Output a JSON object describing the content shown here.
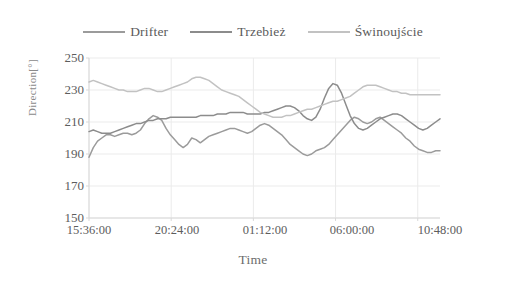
{
  "chart_data": {
    "type": "line",
    "title": "",
    "xlabel": "Time",
    "ylabel": "Direction[°]",
    "ylim": [
      150,
      250
    ],
    "yticks": [
      150,
      170,
      190,
      210,
      230,
      250
    ],
    "xticks": [
      "15:36:00",
      "20:24:00",
      "01:12:00",
      "06:00:00",
      "10:48:00"
    ],
    "xtick_minutes": [
      936,
      1224,
      72,
      360,
      648
    ],
    "grid": true,
    "legend_position": "top-center",
    "x_unit": "hours from 15:36:00",
    "xlim_hours": [
      0,
      20.5
    ],
    "series": [
      {
        "name": "Drifter",
        "color": "#9b9b9b",
        "x": [
          0.0,
          0.25,
          0.5,
          0.75,
          1.0,
          1.25,
          1.5,
          1.75,
          2.0,
          2.25,
          2.5,
          2.75,
          3.0,
          3.25,
          3.5,
          3.75,
          4.0,
          4.25,
          4.5,
          4.75,
          5.0,
          5.25,
          5.5,
          5.75,
          6.0,
          6.25,
          6.5,
          6.75,
          7.0,
          7.25,
          7.5,
          7.75,
          8.0,
          8.25,
          8.5,
          8.75,
          9.0,
          9.25,
          9.5,
          9.75,
          10.0,
          10.25,
          10.5,
          10.75,
          11.0,
          11.25,
          11.5,
          11.75,
          12.0,
          12.25,
          12.5,
          12.75,
          13.0,
          13.25,
          13.5,
          13.75,
          14.0,
          14.25,
          14.5,
          14.75,
          15.0,
          15.25,
          15.5,
          15.75,
          16.0,
          16.25,
          16.5,
          16.75,
          17.0,
          17.25,
          17.5,
          17.75,
          18.0,
          18.25,
          18.5,
          18.75,
          19.0,
          19.25,
          19.5,
          19.75,
          20.0,
          20.25,
          20.5
        ],
        "y": [
          188,
          194,
          198,
          200,
          202,
          202,
          201,
          202,
          203,
          203,
          202,
          203,
          205,
          209,
          212,
          214,
          213,
          211,
          206,
          202,
          199,
          196,
          194,
          196,
          200,
          199,
          197,
          199,
          201,
          202,
          203,
          204,
          205,
          206,
          206,
          205,
          204,
          203,
          204,
          206,
          208,
          209,
          208,
          206,
          204,
          202,
          199,
          196,
          194,
          192,
          190,
          189,
          190,
          192,
          193,
          194,
          196,
          199,
          202,
          205,
          208,
          211,
          213,
          212,
          210,
          209,
          210,
          212,
          213,
          211,
          209,
          207,
          205,
          203,
          200,
          198,
          195,
          193,
          192,
          191,
          191,
          192,
          192
        ]
      },
      {
        "name": "Trzebież",
        "color": "#8c8c8c",
        "x": [
          0.0,
          0.25,
          0.5,
          0.75,
          1.0,
          1.25,
          1.5,
          1.75,
          2.0,
          2.25,
          2.5,
          2.75,
          3.0,
          3.25,
          3.5,
          3.75,
          4.0,
          4.25,
          4.5,
          4.75,
          5.0,
          5.25,
          5.5,
          5.75,
          6.0,
          6.25,
          6.5,
          6.75,
          7.0,
          7.25,
          7.5,
          7.75,
          8.0,
          8.25,
          8.5,
          8.75,
          9.0,
          9.25,
          9.5,
          9.75,
          10.0,
          10.25,
          10.5,
          10.75,
          11.0,
          11.25,
          11.5,
          11.75,
          12.0,
          12.25,
          12.5,
          12.75,
          13.0,
          13.25,
          13.5,
          13.75,
          14.0,
          14.25,
          14.5,
          14.75,
          15.0,
          15.25,
          15.5,
          15.75,
          16.0,
          16.25,
          16.5,
          16.75,
          17.0,
          17.25,
          17.5,
          17.75,
          18.0,
          18.25,
          18.5,
          18.75,
          19.0,
          19.25,
          19.5,
          19.75,
          20.0,
          20.25,
          20.5
        ],
        "y": [
          204,
          205,
          204,
          203,
          203,
          203,
          204,
          205,
          206,
          207,
          208,
          209,
          209,
          210,
          211,
          211,
          212,
          212,
          212,
          213,
          213,
          213,
          213,
          213,
          213,
          213,
          214,
          214,
          214,
          214,
          215,
          215,
          215,
          216,
          216,
          216,
          216,
          215,
          215,
          215,
          215,
          216,
          216,
          217,
          218,
          219,
          220,
          220,
          219,
          217,
          214,
          212,
          211,
          213,
          218,
          225,
          231,
          234,
          233,
          228,
          221,
          214,
          209,
          206,
          205,
          206,
          208,
          210,
          212,
          213,
          214,
          215,
          215,
          214,
          212,
          210,
          208,
          206,
          205,
          206,
          208,
          210,
          212
        ]
      },
      {
        "name": "Świnoujście",
        "color": "#c2c2c2",
        "x": [
          0.0,
          0.25,
          0.5,
          0.75,
          1.0,
          1.25,
          1.5,
          1.75,
          2.0,
          2.25,
          2.5,
          2.75,
          3.0,
          3.25,
          3.5,
          3.75,
          4.0,
          4.25,
          4.5,
          4.75,
          5.0,
          5.25,
          5.5,
          5.75,
          6.0,
          6.25,
          6.5,
          6.75,
          7.0,
          7.25,
          7.5,
          7.75,
          8.0,
          8.25,
          8.5,
          8.75,
          9.0,
          9.25,
          9.5,
          9.75,
          10.0,
          10.25,
          10.5,
          10.75,
          11.0,
          11.25,
          11.5,
          11.75,
          12.0,
          12.25,
          12.5,
          12.75,
          13.0,
          13.25,
          13.5,
          13.75,
          14.0,
          14.25,
          14.5,
          14.75,
          15.0,
          15.25,
          15.5,
          15.75,
          16.0,
          16.25,
          16.5,
          16.75,
          17.0,
          17.25,
          17.5,
          17.75,
          18.0,
          18.25,
          18.5,
          18.75,
          19.0,
          19.25,
          19.5,
          19.75,
          20.0,
          20.25,
          20.5
        ],
        "y": [
          235,
          236,
          235,
          234,
          233,
          232,
          231,
          230,
          230,
          229,
          229,
          229,
          230,
          231,
          231,
          230,
          229,
          229,
          230,
          231,
          232,
          233,
          234,
          235,
          237,
          238,
          238,
          237,
          236,
          234,
          232,
          230,
          229,
          228,
          227,
          226,
          224,
          222,
          220,
          218,
          216,
          215,
          214,
          213,
          213,
          213,
          214,
          214,
          215,
          216,
          217,
          218,
          218,
          219,
          220,
          221,
          222,
          223,
          223,
          224,
          225,
          226,
          228,
          230,
          232,
          233,
          233,
          233,
          232,
          231,
          230,
          229,
          229,
          228,
          228,
          227,
          227,
          227,
          227,
          227,
          227,
          227,
          227
        ]
      }
    ]
  },
  "legend": {
    "entries": [
      {
        "label": "Drifter",
        "color": "#9b9b9b"
      },
      {
        "label": "Trzebież",
        "color": "#8c8c8c"
      },
      {
        "label": "Świnoujście",
        "color": "#c2c2c2"
      }
    ]
  },
  "axes": {
    "y_title": "Direction[°]",
    "x_title": "Time",
    "y_ticks": [
      "250",
      "230",
      "210",
      "190",
      "170",
      "150"
    ],
    "x_ticks": [
      "15:36:00",
      "20:24:00",
      "01:12:00",
      "06:00:00",
      "10:48:00"
    ]
  },
  "style": {
    "axis_color": "#d9d9d9",
    "grid_color": "#ebebeb",
    "text_color": "#5d5d5d"
  }
}
